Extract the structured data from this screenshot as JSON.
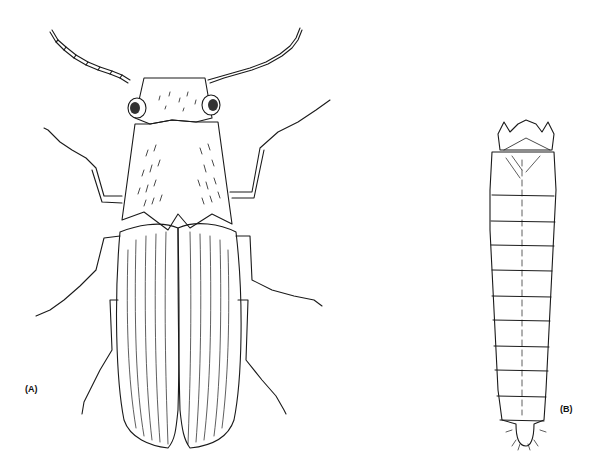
{
  "figure": {
    "panels": [
      {
        "id": "A",
        "label": "(A)",
        "subject": "adult beetle (dorsal view)"
      },
      {
        "id": "B",
        "label": "(B)",
        "subject": "larva (dorsal view)"
      }
    ],
    "colors": {
      "background": "#ffffff",
      "ink": "#1a1a1a"
    }
  }
}
